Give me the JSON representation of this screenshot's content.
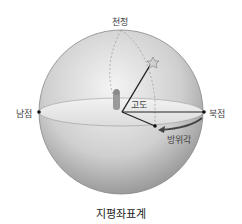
{
  "diagram": {
    "title": "지평좌표계",
    "labels": {
      "zenith": "천정",
      "south": "남점",
      "north": "북점",
      "altitude": "고도",
      "azimuth": "방위각"
    },
    "colors": {
      "sphere_light": "#e6e6e6",
      "sphere_dark": "#9a9a9a",
      "horizon_plane": "#ececec",
      "lines": "#222222",
      "arrow": "#444444",
      "star": "#bbbbbb"
    }
  }
}
